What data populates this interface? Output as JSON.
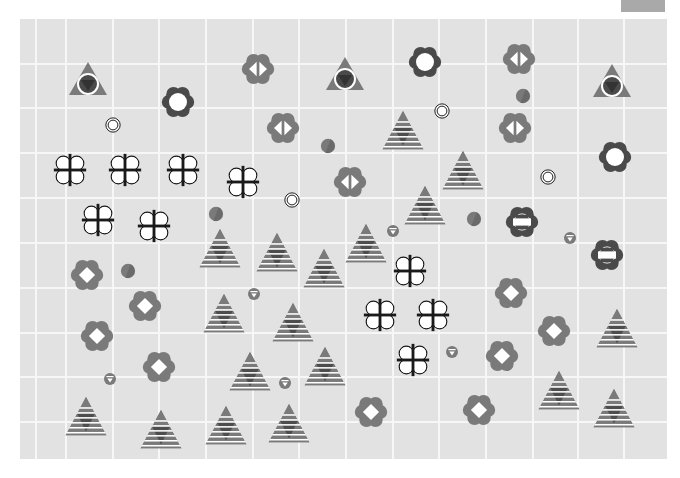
{
  "top_button": {
    "color": "#a9a9a9"
  },
  "board": {
    "background": "#e2e2e2",
    "grid_color": "#f7f7f7",
    "vertical_lines_x": [
      15,
      45,
      92,
      138,
      185,
      232,
      278,
      325,
      372,
      418,
      465,
      512,
      557,
      603
    ],
    "horizontal_lines_y": [
      44,
      88,
      133,
      178,
      223,
      268,
      313,
      357,
      402
    ]
  },
  "colors": {
    "dark": "#4a4a4a",
    "medium": "#7a7a7a",
    "light_shade": "#8a8a8a",
    "white": "#ffffff",
    "black": "#1a1a1a"
  },
  "piece_types": {
    "tri-eye": "triangle with ringed dark circle",
    "flower-o": "dark flower with white disc",
    "rings": "concentric rings",
    "flower-lr": "flower with split white diamond",
    "clover-plus": "white clover with black cross",
    "half-disc": "two-tone disc",
    "pyramid": "striped pyramid",
    "flower-eq": "dark flower with equals bars",
    "pin": "disc with down triangle",
    "flower-diamond": "flower with white diamond"
  },
  "pieces": [
    {
      "type": "tri-eye",
      "x": 88,
      "y": 80
    },
    {
      "type": "tri-eye",
      "x": 345,
      "y": 75
    },
    {
      "type": "tri-eye",
      "x": 612,
      "y": 82
    },
    {
      "type": "flower-o",
      "x": 178,
      "y": 102
    },
    {
      "type": "flower-o",
      "x": 425,
      "y": 62
    },
    {
      "type": "flower-o",
      "x": 615,
      "y": 157
    },
    {
      "type": "rings",
      "x": 113,
      "y": 125
    },
    {
      "type": "rings",
      "x": 442,
      "y": 111
    },
    {
      "type": "rings",
      "x": 548,
      "y": 177
    },
    {
      "type": "rings",
      "x": 292,
      "y": 200
    },
    {
      "type": "flower-lr",
      "x": 258,
      "y": 69
    },
    {
      "type": "flower-lr",
      "x": 519,
      "y": 59
    },
    {
      "type": "flower-lr",
      "x": 283,
      "y": 128
    },
    {
      "type": "flower-lr",
      "x": 515,
      "y": 128
    },
    {
      "type": "flower-lr",
      "x": 350,
      "y": 182
    },
    {
      "type": "clover-plus",
      "x": 70,
      "y": 170
    },
    {
      "type": "clover-plus",
      "x": 125,
      "y": 170
    },
    {
      "type": "clover-plus",
      "x": 183,
      "y": 170
    },
    {
      "type": "clover-plus",
      "x": 243,
      "y": 182
    },
    {
      "type": "clover-plus",
      "x": 98,
      "y": 220
    },
    {
      "type": "clover-plus",
      "x": 154,
      "y": 226
    },
    {
      "type": "clover-plus",
      "x": 410,
      "y": 271
    },
    {
      "type": "clover-plus",
      "x": 380,
      "y": 315
    },
    {
      "type": "clover-plus",
      "x": 433,
      "y": 315
    },
    {
      "type": "clover-plus",
      "x": 413,
      "y": 360
    },
    {
      "type": "half-disc",
      "x": 523,
      "y": 96
    },
    {
      "type": "half-disc",
      "x": 328,
      "y": 146
    },
    {
      "type": "half-disc",
      "x": 216,
      "y": 214
    },
    {
      "type": "half-disc",
      "x": 474,
      "y": 219
    },
    {
      "type": "half-disc",
      "x": 128,
      "y": 271
    },
    {
      "type": "pyramid",
      "x": 403,
      "y": 130
    },
    {
      "type": "pyramid",
      "x": 463,
      "y": 170
    },
    {
      "type": "pyramid",
      "x": 425,
      "y": 205
    },
    {
      "type": "pyramid",
      "x": 220,
      "y": 248
    },
    {
      "type": "pyramid",
      "x": 277,
      "y": 252
    },
    {
      "type": "pyramid",
      "x": 324,
      "y": 268
    },
    {
      "type": "pyramid",
      "x": 366,
      "y": 243
    },
    {
      "type": "pyramid",
      "x": 224,
      "y": 313
    },
    {
      "type": "pyramid",
      "x": 293,
      "y": 322
    },
    {
      "type": "pyramid",
      "x": 250,
      "y": 371
    },
    {
      "type": "pyramid",
      "x": 325,
      "y": 366
    },
    {
      "type": "pyramid",
      "x": 86,
      "y": 416
    },
    {
      "type": "pyramid",
      "x": 161,
      "y": 429
    },
    {
      "type": "pyramid",
      "x": 226,
      "y": 425
    },
    {
      "type": "pyramid",
      "x": 289,
      "y": 423
    },
    {
      "type": "pyramid",
      "x": 617,
      "y": 328
    },
    {
      "type": "pyramid",
      "x": 559,
      "y": 390
    },
    {
      "type": "pyramid",
      "x": 614,
      "y": 408
    },
    {
      "type": "flower-eq",
      "x": 522,
      "y": 222
    },
    {
      "type": "flower-eq",
      "x": 607,
      "y": 255
    },
    {
      "type": "pin",
      "x": 393,
      "y": 231
    },
    {
      "type": "pin",
      "x": 570,
      "y": 238
    },
    {
      "type": "pin",
      "x": 254,
      "y": 294
    },
    {
      "type": "pin",
      "x": 452,
      "y": 352
    },
    {
      "type": "pin",
      "x": 285,
      "y": 383
    },
    {
      "type": "pin",
      "x": 110,
      "y": 379
    },
    {
      "type": "flower-diamond",
      "x": 87,
      "y": 275
    },
    {
      "type": "flower-diamond",
      "x": 145,
      "y": 306
    },
    {
      "type": "flower-diamond",
      "x": 97,
      "y": 336
    },
    {
      "type": "flower-diamond",
      "x": 159,
      "y": 367
    },
    {
      "type": "flower-diamond",
      "x": 511,
      "y": 293
    },
    {
      "type": "flower-diamond",
      "x": 554,
      "y": 331
    },
    {
      "type": "flower-diamond",
      "x": 502,
      "y": 356
    },
    {
      "type": "flower-diamond",
      "x": 371,
      "y": 412
    },
    {
      "type": "flower-diamond",
      "x": 479,
      "y": 410
    }
  ]
}
